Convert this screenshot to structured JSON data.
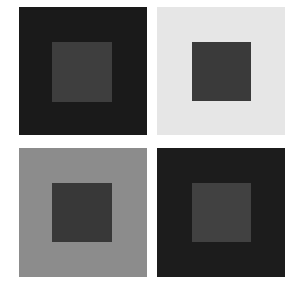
{
  "figure": {
    "background": "#ffffff",
    "panels": [
      {
        "id": "top-left",
        "outer": {
          "x": 19,
          "y": 7,
          "w": 128,
          "h": 128,
          "color": "#1a1a1a"
        },
        "inner": {
          "x": 33,
          "y": 35,
          "w": 60,
          "h": 60,
          "color": "#3e3e3e"
        }
      },
      {
        "id": "top-right",
        "outer": {
          "x": 157,
          "y": 7,
          "w": 128,
          "h": 128,
          "color": "#e6e6e6"
        },
        "inner": {
          "x": 35,
          "y": 35,
          "w": 59,
          "h": 59,
          "color": "#3a3a3a"
        }
      },
      {
        "id": "bottom-left",
        "outer": {
          "x": 19,
          "y": 148,
          "w": 128,
          "h": 129,
          "color": "#8c8c8c"
        },
        "inner": {
          "x": 33,
          "y": 35,
          "w": 60,
          "h": 59,
          "color": "#383838"
        }
      },
      {
        "id": "bottom-right",
        "outer": {
          "x": 157,
          "y": 148,
          "w": 128,
          "h": 129,
          "color": "#1c1c1c"
        },
        "inner": {
          "x": 35,
          "y": 35,
          "w": 59,
          "h": 59,
          "color": "#414141"
        }
      }
    ]
  }
}
